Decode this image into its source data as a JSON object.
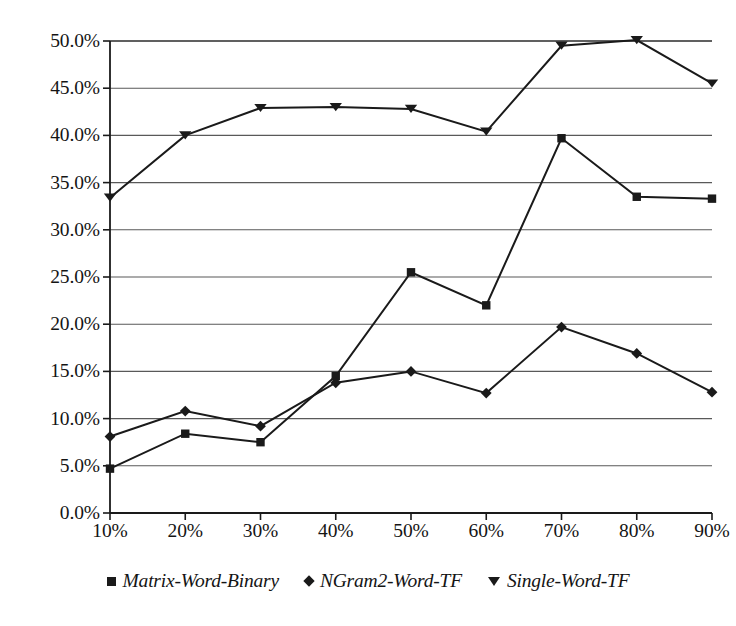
{
  "chart_data": {
    "type": "line",
    "title": "",
    "subtitle": "",
    "xlabel": "",
    "ylabel": "",
    "categories": [
      "10%",
      "20%",
      "30%",
      "40%",
      "50%",
      "60%",
      "70%",
      "80%",
      "90%"
    ],
    "x": [
      10,
      20,
      30,
      40,
      50,
      60,
      70,
      80,
      90
    ],
    "series": [
      {
        "name": "Matrix-Word-Binary",
        "marker": "square",
        "color": "#1a1a1a",
        "values": [
          4.7,
          8.4,
          7.5,
          14.5,
          25.5,
          22.0,
          39.7,
          33.5,
          33.3
        ]
      },
      {
        "name": "NGram2-Word-TF",
        "marker": "diamond",
        "color": "#1a1a1a",
        "values": [
          8.1,
          10.8,
          9.2,
          13.8,
          15.0,
          12.7,
          19.7,
          16.9,
          12.8
        ]
      },
      {
        "name": "Single-Word-TF",
        "marker": "triangle-down",
        "color": "#1a1a1a",
        "values": [
          33.4,
          40.0,
          42.9,
          43.0,
          42.8,
          40.4,
          49.5,
          50.1,
          45.5
        ]
      }
    ],
    "ylim": [
      0,
      50
    ],
    "xlim": [
      10,
      90
    ],
    "ytick_values": [
      0,
      5,
      10,
      15,
      20,
      25,
      30,
      35,
      40,
      45,
      50
    ],
    "ytick_labels": [
      "0.0%",
      "5.0%",
      "10.0%",
      "15.0%",
      "20.0%",
      "25.0%",
      "30.0%",
      "35.0%",
      "40.0%",
      "45.0%",
      "50.0%"
    ],
    "xtick_labels": [
      "10%",
      "20%",
      "30%",
      "40%",
      "50%",
      "60%",
      "70%",
      "80%",
      "90%"
    ],
    "grid": {
      "horizontal": true,
      "vertical": false,
      "color": "#595959"
    },
    "legend": {
      "position": "bottom",
      "entries": [
        {
          "label": "Matrix-Word-Binary",
          "marker": "square"
        },
        {
          "label": "NGram2-Word-TF",
          "marker": "diamond"
        },
        {
          "label": "Single-Word-TF",
          "marker": "triangle-down"
        }
      ]
    },
    "axis_color": "#1a1a1a",
    "background": "#ffffff"
  }
}
